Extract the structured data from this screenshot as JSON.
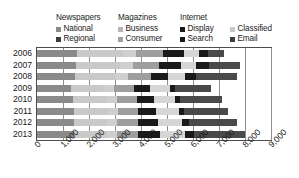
{
  "chart_data": {
    "type": "bar",
    "orientation": "horizontal",
    "stacked": true,
    "title": "",
    "subtitle": "",
    "xlabel": "",
    "ylabel": "",
    "xlim": [
      0,
      9000
    ],
    "ylim": null,
    "grid": true,
    "gridlines_axis": "x",
    "legend_position": "top",
    "categories": [
      "2006",
      "2007",
      "2008",
      "2009",
      "2010",
      "2011",
      "2012",
      "2013"
    ],
    "xticks": [
      "0",
      "1,000",
      "2,000",
      "3,000",
      "4,000",
      "5,000",
      "6,000",
      "7,000",
      "8,000",
      "9,000"
    ],
    "xtick_values": [
      0,
      1000,
      2000,
      3000,
      4000,
      5000,
      6000,
      7000,
      8000,
      9000
    ],
    "series": [
      {
        "name": "National",
        "group": "Newspapers",
        "color": "#8a8a8a",
        "values": [
          1550,
          1500,
          1450,
          1300,
          1400,
          1420,
          1430,
          1440
        ]
      },
      {
        "name": "Regional",
        "group": "Newspapers",
        "color": "#c9c9c9",
        "values": [
          1750,
          1700,
          1600,
          1300,
          1300,
          1300,
          1280,
          1260
        ]
      },
      {
        "name": "Business",
        "group": "Magazines",
        "color": "#cfcfcf",
        "values": [
          520,
          500,
          450,
          380,
          380,
          380,
          370,
          360
        ]
      },
      {
        "name": "Consumer",
        "group": "Magazines",
        "color": "#9e9e9e",
        "values": [
          1030,
          1000,
          900,
          760,
          780,
          790,
          800,
          810
        ]
      },
      {
        "name": "Display",
        "group": "Internet",
        "color": "#1a1a1a",
        "values": [
          820,
          840,
          640,
          620,
          640,
          700,
          780,
          860
        ]
      },
      {
        "name": "Classified",
        "group": "Internet",
        "color": "#d6d6d6",
        "values": [
          560,
          570,
          660,
          760,
          800,
          860,
          900,
          950
        ]
      },
      {
        "name": "Search",
        "group": "Internet",
        "color": "#1a1a1a",
        "values": [
          330,
          520,
          420,
          200,
          190,
          220,
          280,
          360
        ]
      },
      {
        "name": "Email",
        "group": "Internet",
        "color": "#4a4a4a",
        "values": [
          640,
          1170,
          1580,
          1380,
          1610,
          1680,
          1860,
          1964
        ]
      }
    ],
    "totals": [
      7200,
      7800,
      7700,
      6700,
      7100,
      7350,
      7700,
      8000
    ]
  },
  "legend": {
    "groups": [
      {
        "title": "Newspapers",
        "items": [
          {
            "label": "National",
            "color": "#8a8a8a",
            "swatch": "legend-swatch"
          },
          {
            "label": "Regional",
            "color": "#3d3d3d",
            "swatch": "legend-swatch"
          }
        ]
      },
      {
        "title": "Magazines",
        "items": [
          {
            "label": "Business",
            "color": "#b5b5b5",
            "swatch": "legend-swatch"
          },
          {
            "label": "Consumer",
            "color": "#9e9e9e",
            "swatch": "legend-swatch"
          }
        ]
      },
      {
        "title": "Internet",
        "items": [
          {
            "label": "Display",
            "color": "#1a1a1a",
            "swatch": "legend-swatch"
          },
          {
            "label": "Classified",
            "color": "#c9c9c9",
            "swatch": "legend-swatch"
          },
          {
            "label": "Search",
            "color": "#1a1a1a",
            "swatch": "legend-swatch"
          },
          {
            "label": "Email",
            "color": "#3d3d3d",
            "swatch": "legend-swatch"
          }
        ]
      }
    ]
  },
  "colors": {
    "axis": "#4d4d4d",
    "gridline": "#8f8f8f",
    "text": "#1b1b1b",
    "background": "#ffffff"
  }
}
